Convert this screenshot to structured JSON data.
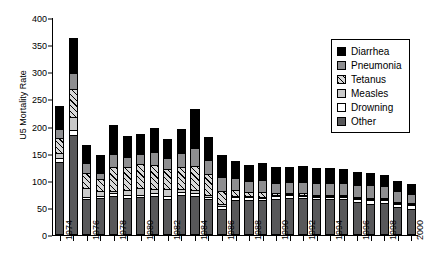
{
  "chart_data": {
    "type": "bar",
    "title": "",
    "xlabel": "",
    "ylabel": "U5 Mortality Rate",
    "ylim": [
      0,
      400
    ],
    "yticks": [
      0,
      50,
      100,
      150,
      200,
      250,
      300,
      350,
      400
    ],
    "grid": false,
    "stacked": true,
    "legend_position": "top-right",
    "categories": [
      "1974",
      "1975",
      "1976",
      "1977",
      "1978",
      "1979",
      "1980",
      "1981",
      "1982",
      "1983",
      "1984",
      "1985",
      "1986",
      "1987",
      "1988",
      "1989",
      "1990",
      "1991",
      "1992",
      "1993",
      "1994",
      "1995",
      "1996",
      "1997",
      "1998",
      "1999",
      "2000"
    ],
    "xtick_labels": [
      "1974",
      "",
      "1976",
      "",
      "1978",
      "",
      "1980",
      "",
      "1982",
      "",
      "1984",
      "",
      "1986",
      "",
      "1988",
      "",
      "1990",
      "",
      "1992",
      "",
      "1994",
      "",
      "1996",
      "",
      "1998",
      "",
      "2000"
    ],
    "series": [
      {
        "name": "Other",
        "color": "#58585a",
        "values": [
          130,
          180,
          62,
          65,
          68,
          65,
          66,
          68,
          62,
          70,
          68,
          62,
          44,
          60,
          60,
          60,
          62,
          64,
          64,
          62,
          62,
          62,
          58,
          54,
          55,
          48,
          44
        ]
      },
      {
        "name": "Drowning",
        "color": "#ffffff",
        "values": [
          8,
          10,
          5,
          4,
          5,
          5,
          5,
          5,
          6,
          6,
          6,
          5,
          6,
          6,
          6,
          5,
          6,
          6,
          5,
          5,
          5,
          5,
          5,
          6,
          6,
          6,
          7
        ]
      },
      {
        "name": "Measles",
        "color": "#c9c9c9",
        "values": [
          10,
          23,
          16,
          8,
          4,
          10,
          12,
          8,
          14,
          5,
          6,
          4,
          3,
          3,
          2,
          2,
          2,
          2,
          2,
          2,
          2,
          2,
          2,
          2,
          1,
          1,
          1
        ]
      },
      {
        "name": "Tetanus",
        "color": "#d8d8d8",
        "hatch": "diagonal",
        "values": [
          27,
          52,
          28,
          22,
          45,
          42,
          45,
          44,
          36,
          40,
          44,
          38,
          24,
          10,
          8,
          8,
          3,
          2,
          2,
          2,
          2,
          2,
          2,
          2,
          2,
          1,
          1
        ]
      },
      {
        "name": "Pneumonia",
        "color": "#8e8e90",
        "values": [
          17,
          30,
          18,
          12,
          23,
          18,
          18,
          24,
          20,
          26,
          32,
          26,
          26,
          22,
          20,
          22,
          20,
          20,
          22,
          22,
          22,
          22,
          22,
          24,
          22,
          20,
          18
        ]
      },
      {
        "name": "Diarrhea",
        "color": "#000000",
        "values": [
          42,
          65,
          33,
          32,
          55,
          38,
          36,
          44,
          36,
          45,
          72,
          43,
          40,
          32,
          30,
          32,
          28,
          28,
          28,
          27,
          27,
          25,
          23,
          22,
          20,
          18,
          17
        ]
      }
    ],
    "totals": [
      234,
      360,
      162,
      143,
      200,
      178,
      182,
      193,
      174,
      192,
      228,
      178,
      143,
      133,
      126,
      129,
      121,
      122,
      123,
      120,
      120,
      118,
      112,
      110,
      106,
      94,
      88
    ]
  },
  "legend": {
    "items": [
      {
        "label": "Diarrhea",
        "swatch": "swatch-diarrhea"
      },
      {
        "label": "Pneumonia",
        "swatch": "swatch-pneumonia"
      },
      {
        "label": "Tetanus",
        "swatch": "swatch-tetanus"
      },
      {
        "label": "Measles",
        "swatch": "swatch-measles"
      },
      {
        "label": "Drowning",
        "swatch": "swatch-drowning"
      },
      {
        "label": "Other",
        "swatch": "swatch-other"
      }
    ]
  }
}
